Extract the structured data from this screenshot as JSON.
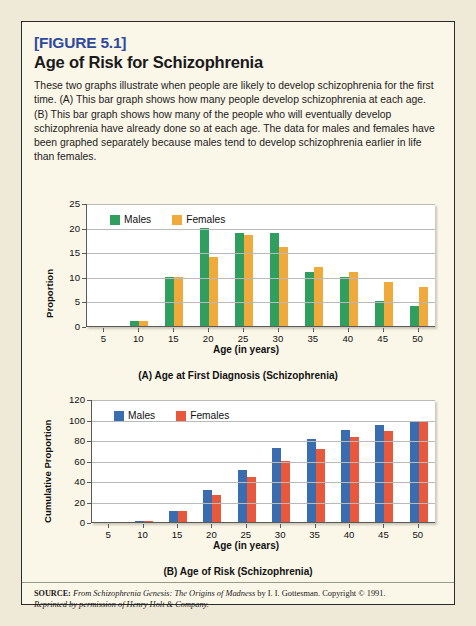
{
  "figure": {
    "label": "[FIGURE 5.1]",
    "title": "Age of Risk for Schizophrenia",
    "description": "These two graphs illustrate when people are likely to develop schizophrenia for the first time. (A) This bar graph shows how many people develop schizophrenia at each age. (B) This bar graph shows how many of the people who will eventually develop schizophrenia have already done so at each age. The data for males and females have been graphed separately because males tend to develop schizophrenia earlier in life than females.",
    "source_prefix": "SOURCE:",
    "source_line1_italic_a": "From Schizophrenia Genesis: The Origins of Madness",
    "source_line1_plain": " by I. I. Gottesman. Copyright © 1991.",
    "source_line2": "Reprinted by permission of Henry Holt & Company."
  },
  "colors": {
    "males_a": "#2f9e5e",
    "females_a": "#f0aa3c",
    "males_b": "#3a6cb0",
    "females_b": "#e8583c",
    "figure_label": "#2d4a9e",
    "page_background": "#efe9d8",
    "card_background": "#faf6e8",
    "plot_background": "#ffffff",
    "gridline": "#b9b9b9",
    "axis": "#5a5a5a"
  },
  "chart_data": [
    {
      "id": "panel-a",
      "type": "bar",
      "title": "(A) Age at First Diagnosis (Schizophrenia)",
      "xlabel": "Age (in years)",
      "ylabel": "Proportion",
      "categories": [
        "5",
        "10",
        "15",
        "20",
        "25",
        "30",
        "35",
        "40",
        "45",
        "50"
      ],
      "ylim": [
        0,
        25
      ],
      "yticks": [
        0,
        5,
        10,
        15,
        20,
        25
      ],
      "grid": true,
      "legend_position": "top-left",
      "series": [
        {
          "name": "Males",
          "color": "#2f9e5e",
          "values": [
            0,
            1,
            10,
            20,
            19,
            19,
            11,
            10,
            5,
            4
          ]
        },
        {
          "name": "Females",
          "color": "#f0aa3c",
          "values": [
            0,
            1,
            10,
            14,
            18.5,
            16,
            12,
            11,
            9,
            8
          ]
        }
      ]
    },
    {
      "id": "panel-b",
      "type": "bar",
      "title": "(B) Age of Risk (Schizophrenia)",
      "xlabel": "Age (in years)",
      "ylabel": "Cumulative Proportion",
      "categories": [
        "5",
        "10",
        "15",
        "20",
        "25",
        "30",
        "35",
        "40",
        "45",
        "50"
      ],
      "ylim": [
        0,
        120
      ],
      "yticks": [
        0,
        20,
        40,
        60,
        80,
        100,
        120
      ],
      "grid": true,
      "legend_position": "top-left",
      "series": [
        {
          "name": "Males",
          "color": "#3a6cb0",
          "values": [
            0,
            1,
            11,
            31,
            51,
            72,
            81,
            90,
            95,
            99
          ]
        },
        {
          "name": "Females",
          "color": "#e8583c",
          "values": [
            0,
            1,
            11,
            26,
            44,
            60,
            71,
            83,
            89,
            99
          ]
        }
      ]
    }
  ]
}
